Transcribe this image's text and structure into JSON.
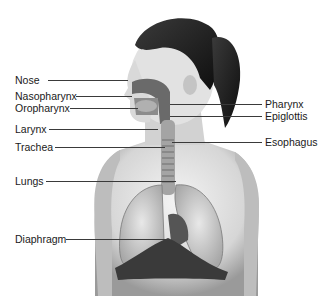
{
  "diagram": {
    "left_labels": [
      {
        "text": "Nose",
        "x": 15,
        "y": 74,
        "line_from": 48,
        "line_to": 128,
        "line_y": 80
      },
      {
        "text": "Nasopharynx",
        "x": 15,
        "y": 90,
        "line_from": 76,
        "line_to": 132,
        "line_y": 96
      },
      {
        "text": "Oropharynx",
        "x": 15,
        "y": 102,
        "line_from": 70,
        "line_to": 138,
        "line_y": 108
      },
      {
        "text": "Larynx",
        "x": 15,
        "y": 123,
        "line_from": 49,
        "line_to": 158,
        "line_y": 129
      },
      {
        "text": "Trachea",
        "x": 15,
        "y": 141,
        "line_from": 55,
        "line_to": 165,
        "line_y": 147
      },
      {
        "text": "Lungs",
        "x": 15,
        "y": 175,
        "line_from": 46,
        "line_to": 176,
        "line_y": 181
      },
      {
        "text": "Diaphragm",
        "x": 15,
        "y": 233,
        "line_from": 66,
        "line_to": 168,
        "line_y": 239
      }
    ],
    "right_labels": [
      {
        "text": "Pharynx",
        "x": 265,
        "y": 98,
        "line_from": 170,
        "line_to": 262,
        "line_y": 104
      },
      {
        "text": "Epiglottis",
        "x": 265,
        "y": 110,
        "line_from": 170,
        "line_to": 262,
        "line_y": 116
      },
      {
        "text": "Esophagus",
        "x": 265,
        "y": 136,
        "line_from": 172,
        "line_to": 262,
        "line_y": 142
      }
    ]
  }
}
